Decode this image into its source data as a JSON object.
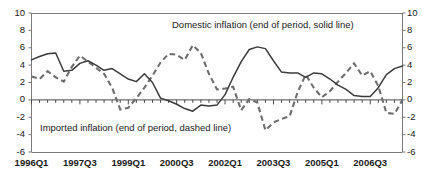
{
  "chart_data": {
    "type": "line",
    "title": "",
    "subtitle": "",
    "xlabel": "",
    "ylabel": "",
    "ylim": [
      -6,
      10
    ],
    "y_ticks": [
      10,
      8,
      6,
      4,
      2,
      0,
      -2,
      -4,
      -6
    ],
    "y_tick_labels_left": [
      "10",
      "8",
      "6",
      "4",
      "2",
      "0",
      "-2",
      "-4",
      "-6"
    ],
    "y_tick_labels_right": [
      "10",
      "8",
      "6",
      "4",
      "2",
      "0",
      "-2",
      "-4",
      "-6"
    ],
    "grid": false,
    "zero_line": true,
    "dual_axis": true,
    "legend_position": "inline-annotations",
    "x_tick_labels": [
      "1996Q1",
      "1997Q3",
      "1999Q1",
      "2000Q3",
      "2002Q1",
      "2003Q3",
      "2005Q1",
      "2006Q3"
    ],
    "x_tick_indices": [
      0,
      6,
      12,
      18,
      24,
      30,
      36,
      42
    ],
    "x_quarters": [
      "1996Q1",
      "1996Q2",
      "1996Q3",
      "1996Q4",
      "1997Q1",
      "1997Q2",
      "1997Q3",
      "1997Q4",
      "1998Q1",
      "1998Q2",
      "1998Q3",
      "1998Q4",
      "1999Q1",
      "1999Q2",
      "1999Q3",
      "1999Q4",
      "2000Q1",
      "2000Q2",
      "2000Q3",
      "2000Q4",
      "2001Q1",
      "2001Q2",
      "2001Q3",
      "2001Q4",
      "2002Q1",
      "2002Q2",
      "2002Q3",
      "2002Q4",
      "2003Q1",
      "2003Q2",
      "2003Q3",
      "2003Q4",
      "2004Q1",
      "2004Q2",
      "2004Q3",
      "2004Q4",
      "2005Q1",
      "2005Q2",
      "2005Q3",
      "2005Q4",
      "2006Q1",
      "2006Q2",
      "2006Q3",
      "2006Q4",
      "2007Q1",
      "2007Q2",
      "2007Q3"
    ],
    "annotations": [
      {
        "name": "domestic-note",
        "text": "Domestic inflation (end of period, solid line)"
      },
      {
        "name": "imported-note",
        "text": "Imported inflation (end of period, dashed line)"
      }
    ],
    "series": [
      {
        "name": "Domestic inflation (end of period, solid line)",
        "style": "solid",
        "color": "#3b3b3b",
        "values": [
          4.6,
          5.0,
          5.3,
          5.4,
          3.3,
          3.4,
          4.2,
          4.5,
          4.0,
          3.4,
          3.6,
          3.0,
          2.4,
          2.1,
          3.0,
          2.0,
          0.2,
          -0.1,
          -0.5,
          -1.0,
          -1.3,
          -0.6,
          -0.7,
          -0.6,
          0.6,
          2.6,
          4.4,
          5.8,
          6.1,
          5.9,
          4.5,
          3.2,
          3.1,
          3.1,
          2.6,
          3.1,
          3.0,
          2.4,
          1.7,
          1.2,
          0.5,
          0.4,
          0.4,
          1.4,
          2.9,
          3.6,
          3.9
        ]
      },
      {
        "name": "Imported inflation (end of period, dashed line)",
        "style": "dashed",
        "color": "#6e6e6e",
        "values": [
          2.7,
          2.4,
          3.3,
          2.6,
          2.1,
          3.8,
          5.1,
          4.4,
          3.7,
          3.0,
          1.4,
          -1.1,
          -0.9,
          0.2,
          1.4,
          2.8,
          4.3,
          5.3,
          5.2,
          4.6,
          6.3,
          5.4,
          3.0,
          1.2,
          1.3,
          1.5,
          -1.2,
          0.1,
          -0.3,
          -3.5,
          -2.6,
          -2.2,
          -1.9,
          0.9,
          2.9,
          1.4,
          0.3,
          1.0,
          2.1,
          3.1,
          4.2,
          2.8,
          3.3,
          1.6,
          -1.5,
          -1.6,
          0.0
        ]
      }
    ]
  },
  "axes": {
    "left_label_top": "10",
    "right_label_top": "10"
  },
  "extra_series_tail": {
    "domestic_final": 2.6,
    "imported_final": 1.1
  }
}
